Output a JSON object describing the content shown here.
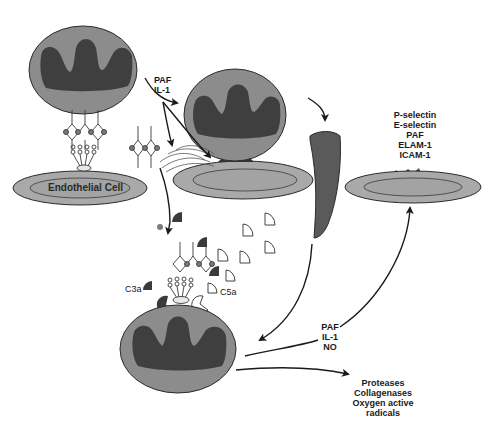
{
  "diagram": {
    "colors": {
      "cell_body": "#8c8c8c",
      "nucleus": "#3f3f3f",
      "endothelial_outer": "#a9a9a9",
      "endothelial_inner": "#9c9c9c",
      "outline": "#2b2b2b",
      "complement_dark": "#3a3a3a",
      "background": "#ffffff"
    },
    "labels": {
      "endothelial_cell": "Endothelial Cell",
      "first_signals": [
        "PAF",
        "IL-1"
      ],
      "activation_markers": [
        "P-selectin",
        "E-selectin",
        "PAF",
        "ELAM-1",
        "ICAM-1"
      ],
      "c3a": "C3a",
      "c5a": "C5a",
      "feedback_signals": [
        "PAF",
        "IL-1",
        "NO"
      ],
      "products": [
        "Proteases",
        "Collagenases",
        "Oxygen active",
        "radicals"
      ]
    },
    "nodes": [
      {
        "id": "leukocyte-rolling",
        "type": "leukocyte"
      },
      {
        "id": "endothelial-cell-1",
        "type": "endothelial"
      },
      {
        "id": "leukocyte-adhering",
        "type": "leukocyte"
      },
      {
        "id": "endothelial-cell-2",
        "type": "endothelial"
      },
      {
        "id": "leukocyte-transmigrating",
        "type": "elongated-leukocyte"
      },
      {
        "id": "endothelial-cell-3",
        "type": "endothelial-activated"
      },
      {
        "id": "leukocyte-activated",
        "type": "leukocyte"
      }
    ]
  }
}
